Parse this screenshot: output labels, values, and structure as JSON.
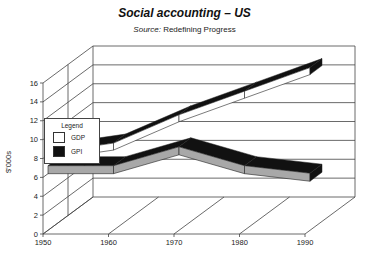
{
  "title": "Social accounting – US",
  "subtitle_prefix": "Source:",
  "subtitle_text": " Redefining Progress",
  "ylabel": "$'000s",
  "legend": {
    "title": "Legend",
    "items": [
      {
        "label": "GDP",
        "color": "#ffffff"
      },
      {
        "label": "GPI",
        "color": "#111111"
      }
    ]
  },
  "x_ticks": [
    "1950",
    "1960",
    "1970",
    "1980",
    "1990"
  ],
  "y_ticks": [
    "0",
    "2",
    "4",
    "6",
    "8",
    "10",
    "12",
    "14",
    "16"
  ],
  "chart_data": {
    "type": "line",
    "style": "3d-ribbon",
    "title": "Social accounting – US",
    "subtitle": "Source: Redefining Progress",
    "xlabel": "",
    "ylabel": "$'000s",
    "x": [
      1950,
      1960,
      1970,
      1980,
      1990
    ],
    "series": [
      {
        "name": "GDP",
        "values": [
          7.5,
          8.5,
          11.5,
          14,
          16.5
        ]
      },
      {
        "name": "GPI",
        "values": [
          6,
          6,
          8,
          6,
          5.2
        ]
      }
    ],
    "ylim": [
      0,
      16
    ],
    "xlim": [
      1950,
      1990
    ],
    "grid": true,
    "legend_position": "left-middle"
  }
}
